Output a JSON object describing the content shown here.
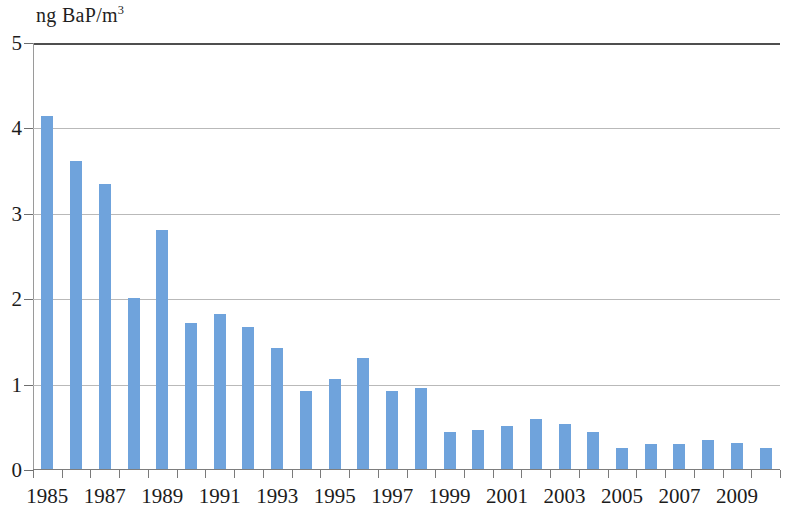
{
  "chart_data": {
    "type": "bar",
    "title": "",
    "subtitle": "",
    "xlabel": "",
    "ylabel": "ng BaP/m3",
    "ylabel_display": "ng BaP/m",
    "ylabel_superscript": "3",
    "ylim": [
      0,
      5
    ],
    "ytick_values": [
      0,
      1,
      2,
      3,
      4,
      5
    ],
    "ytick_labels": [
      "0",
      "1",
      "2",
      "3",
      "4",
      "5"
    ],
    "grid": true,
    "grid_axis": "y",
    "legend": "none",
    "bar_color": "#6fa3dc",
    "categories": [
      "1985",
      "1986",
      "1987",
      "1988",
      "1989",
      "1990",
      "1991",
      "1992",
      "1993",
      "1994",
      "1995",
      "1996",
      "1997",
      "1998",
      "1999",
      "2000",
      "2001",
      "2002",
      "2003",
      "2004",
      "2005",
      "2006",
      "2007",
      "2008",
      "2009",
      "2010"
    ],
    "xtick_labels_shown": [
      "1985",
      "1987",
      "1989",
      "1991",
      "1993",
      "1995",
      "1997",
      "1999",
      "2001",
      "2003",
      "2005",
      "2007",
      "2009"
    ],
    "values": [
      4.14,
      3.62,
      3.35,
      2.02,
      2.81,
      1.72,
      1.83,
      1.68,
      1.43,
      0.92,
      1.07,
      1.31,
      0.93,
      0.96,
      0.45,
      0.47,
      0.52,
      0.6,
      0.54,
      0.44,
      0.26,
      0.31,
      0.3,
      0.35,
      0.32,
      0.26
    ],
    "series": [
      {
        "name": "BaP concentration",
        "values": [
          4.14,
          3.62,
          3.35,
          2.02,
          2.81,
          1.72,
          1.83,
          1.68,
          1.43,
          0.92,
          1.07,
          1.31,
          0.93,
          0.96,
          0.45,
          0.47,
          0.52,
          0.6,
          0.54,
          0.44,
          0.26,
          0.31,
          0.3,
          0.35,
          0.32,
          0.26
        ]
      }
    ]
  }
}
